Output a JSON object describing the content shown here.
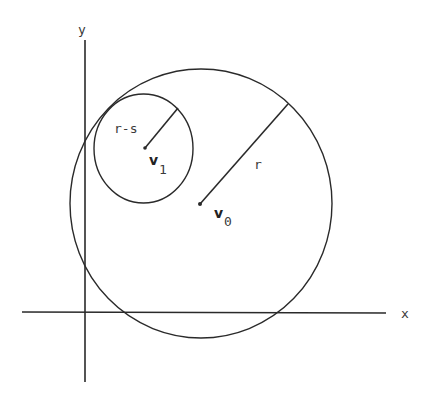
{
  "diagram": {
    "axes": {
      "x_label": "x",
      "y_label": "y"
    },
    "outer_circle": {
      "center_label": "v",
      "center_subscript": "0",
      "radius_label": "r"
    },
    "inner_circle": {
      "center_label": "v",
      "center_subscript": "1",
      "radius_label": "r-s"
    },
    "colors": {
      "stroke": "#2a2a2a",
      "background": "#ffffff"
    }
  }
}
